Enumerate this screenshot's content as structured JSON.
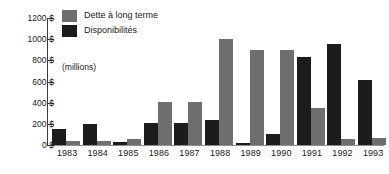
{
  "chart_data": {
    "type": "bar",
    "title": "",
    "subtitle": "",
    "xlabel": "",
    "ylabel": "",
    "units_note": "(millions)",
    "grid": false,
    "legend_position": "top-left",
    "categories": [
      "1983",
      "1984",
      "1985",
      "1986",
      "1987",
      "1988",
      "1989",
      "1990",
      "1991",
      "1992",
      "1993"
    ],
    "ylim": [
      0,
      1200
    ],
    "ytick_labels": [
      "0 $",
      "200 $",
      "400 $",
      "600 $",
      "800 $",
      "1000 $",
      "1200 $"
    ],
    "ytick_values": [
      0,
      200,
      400,
      600,
      800,
      1000,
      1200
    ],
    "series": [
      {
        "name": "Dette à long terme",
        "color": "#6e6e6e",
        "values": [
          40,
          40,
          60,
          410,
          410,
          1000,
          895,
          895,
          350,
          60,
          65
        ]
      },
      {
        "name": "Disponibilités",
        "color": "#1c1c1c",
        "values": [
          150,
          200,
          30,
          205,
          205,
          235,
          20,
          100,
          830,
          950,
          610
        ]
      }
    ]
  },
  "axis": {
    "line_color": "#3a3a3a"
  }
}
